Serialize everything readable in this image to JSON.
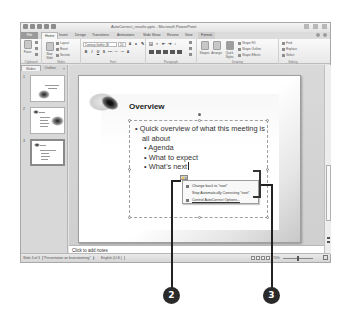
{
  "window": {
    "title": "AutoCorrect_results.pptx - Microsoft PowerPoint",
    "quick_access_icons": [
      "save-icon",
      "undo-icon",
      "redo-icon",
      "customize-icon"
    ],
    "window_controls": [
      "minimize-icon",
      "maximize-icon",
      "close-icon"
    ]
  },
  "ribbon": {
    "tabs": [
      {
        "label": "File",
        "state": "file"
      },
      {
        "label": "Home",
        "state": "active"
      },
      {
        "label": "Insert"
      },
      {
        "label": "Design"
      },
      {
        "label": "Transitions"
      },
      {
        "label": "Animations"
      },
      {
        "label": "Slide Show"
      },
      {
        "label": "Review"
      },
      {
        "label": "View"
      },
      {
        "label": "Format",
        "state": "contextual"
      }
    ],
    "groups": {
      "clipboard": {
        "label": "Clipboard",
        "paste": "Paste"
      },
      "slides": {
        "label": "Slides",
        "new_slide": "New Slide",
        "layout": "Layout",
        "reset": "Reset",
        "section": "Section"
      },
      "font": {
        "label": "Font",
        "font_name": "Century Gothic (B",
        "font_size": "20",
        "buttons": [
          "B",
          "I",
          "U",
          "S",
          "abc",
          "AV",
          "Aa",
          "A"
        ]
      },
      "paragraph": {
        "label": "Paragraph"
      },
      "drawing": {
        "label": "Drawing",
        "shapes": "Shapes",
        "arrange": "Arrange",
        "quick_styles": "Quick Styles",
        "shape_fill": "Shape Fill",
        "shape_outline": "Shape Outline",
        "shape_effects": "Shape Effects"
      },
      "editing": {
        "label": "Editing",
        "find": "Find",
        "replace": "Replace",
        "select": "Select"
      }
    }
  },
  "left_pane": {
    "tabs": [
      {
        "label": "Slides",
        "active": true
      },
      {
        "label": "Outline",
        "active": false
      }
    ],
    "close_glyph": "×",
    "thumbnails": [
      {
        "number": "1",
        "title": "Operations Update",
        "selected": false
      },
      {
        "number": "2",
        "title": "Agenda",
        "selected": false
      },
      {
        "number": "3",
        "title": "Overview",
        "selected": true
      }
    ]
  },
  "slide": {
    "title": "Overview",
    "bullets": [
      {
        "level": 1,
        "text": "Quick overview of what this meeting is all about"
      },
      {
        "level": 2,
        "text": "Agenda"
      },
      {
        "level": 2,
        "text": "What to expect"
      },
      {
        "level": 2,
        "text": "What’s next"
      }
    ],
    "bullet_glyph": "•"
  },
  "autocorrect": {
    "button_glyph": "⚡▾",
    "menu_items": [
      {
        "label": "Change back to \"nxet\"",
        "icon": "undo-icon"
      },
      {
        "label": "Stop Automatically Correcting \"nxet\"",
        "icon": ""
      },
      {
        "label": "Control AutoCorrect Options...",
        "icon": "autocorrect-options-icon"
      }
    ]
  },
  "notes": {
    "placeholder": "Click to add notes"
  },
  "status_bar": {
    "slide_info": "Slide 3 of 3",
    "theme": "\"Presentation on brainstorming\"",
    "language": "English (U.S.)",
    "zoom": "70%"
  },
  "callouts": [
    {
      "number": "2"
    },
    {
      "number": "3"
    }
  ]
}
